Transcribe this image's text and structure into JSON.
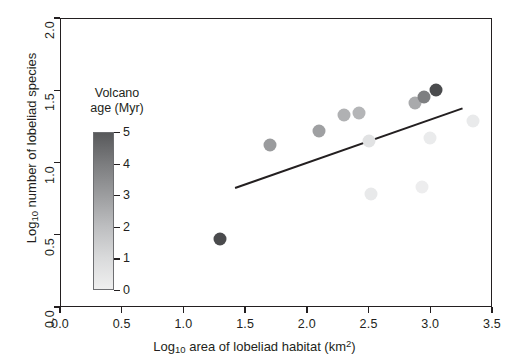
{
  "chart_data": {
    "type": "scatter",
    "title": "",
    "xlabel": "Log10 area of lobeliad habitat (km2)",
    "ylabel": "Log10 number of lobeliad species",
    "xlim": [
      0.0,
      3.5
    ],
    "ylim": [
      0.0,
      2.0
    ],
    "grid": false,
    "legend_position": "inside-left",
    "x_ticks": [
      "0.0",
      "0.5",
      "1.0",
      "1.5",
      "2.0",
      "2.5",
      "3.0",
      "3.5"
    ],
    "x_tick_values": [
      0.0,
      0.5,
      1.0,
      1.5,
      2.0,
      2.5,
      3.0,
      3.5
    ],
    "y_ticks": [
      "0.0",
      "0.5",
      "1.0",
      "1.5",
      "2.0"
    ],
    "y_tick_values": [
      0.0,
      0.5,
      1.0,
      1.5,
      2.0
    ],
    "colorbar": {
      "title_line1": "Volcano",
      "title_line2": "age (Myr)",
      "ticks": [
        "5",
        "4",
        "3",
        "2",
        "1",
        "0"
      ],
      "tick_values": [
        5,
        4,
        3,
        2,
        1,
        0
      ],
      "vmin": 0,
      "vmax": 5,
      "dark_color": "#58595b",
      "light_color": "#efefef",
      "orientation": "vertical",
      "reversed": true
    },
    "points": [
      {
        "x": 1.3,
        "y": 0.47,
        "age": 5.0,
        "color": "#4a4b4d"
      },
      {
        "x": 1.7,
        "y": 1.12,
        "age": 3.3,
        "color": "#9a9b9d"
      },
      {
        "x": 2.1,
        "y": 1.22,
        "age": 3.2,
        "color": "#9fa0a2"
      },
      {
        "x": 2.3,
        "y": 1.33,
        "age": 2.7,
        "color": "#b0b1b3"
      },
      {
        "x": 2.42,
        "y": 1.34,
        "age": 2.6,
        "color": "#b4b5b7"
      },
      {
        "x": 2.5,
        "y": 1.15,
        "age": 0.9,
        "color": "#e1e2e3"
      },
      {
        "x": 2.52,
        "y": 0.78,
        "age": 0.6,
        "color": "#e8e9ea"
      },
      {
        "x": 2.88,
        "y": 1.41,
        "age": 2.9,
        "color": "#a9aaac"
      },
      {
        "x": 2.95,
        "y": 1.45,
        "age": 3.8,
        "color": "#7e7f81"
      },
      {
        "x": 3.05,
        "y": 1.5,
        "age": 5.0,
        "color": "#4a4b4d"
      },
      {
        "x": 2.93,
        "y": 0.83,
        "age": 0.4,
        "color": "#ededee"
      },
      {
        "x": 3.0,
        "y": 1.17,
        "age": 0.5,
        "color": "#eaebec"
      },
      {
        "x": 3.35,
        "y": 1.29,
        "age": 0.5,
        "color": "#e9eaeb"
      }
    ],
    "fit_line": {
      "label": "linear regression fit",
      "x_start": 1.42,
      "y_start": 0.83,
      "x_end": 3.26,
      "y_end": 1.38,
      "color": "#231f20"
    }
  }
}
